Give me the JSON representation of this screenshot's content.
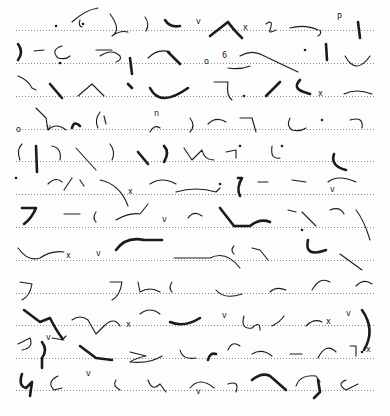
{
  "document": {
    "type": "shorthand-manuscript",
    "script": "Pitman shorthand",
    "ink_color": "#1b1b1b",
    "paper_color": "#fdfdfd",
    "rule_color": "#8a8a8a",
    "rule_x_start": 16,
    "rule_x_end": 376,
    "ruled_lines_y": [
      30,
      63,
      96,
      129,
      161,
      194,
      227,
      260,
      293,
      325,
      358,
      390
    ]
  },
  "strokes": [
    {
      "d": "M72 22 Q85 10 98 8",
      "w": "light"
    },
    {
      "d": "M80 20 Q78 26 82 27",
      "w": "light"
    },
    {
      "d": "M110 14 Q122 30 112 36 Q120 30 128 32",
      "w": "light"
    },
    {
      "d": "M145 17 Q150 24 146 31",
      "w": "light"
    },
    {
      "d": "M165 20 Q170 28 180 26",
      "w": "heavy"
    },
    {
      "d": "M210 36 L228 22 Q232 28 242 38",
      "w": "heavy"
    },
    {
      "d": "M266 24 Q274 18 270 30 Q268 34 276 30",
      "w": "light"
    },
    {
      "d": "M290 28 Q305 24 318 30",
      "w": "light"
    },
    {
      "d": "M320 30 Q322 34 318 36",
      "w": "light"
    },
    {
      "d": "M358 22 L360 38",
      "w": "heavy"
    },
    {
      "d": "M18 44 Q24 52 18 60",
      "w": "heavy"
    },
    {
      "d": "M34 51 L44 50",
      "w": "light"
    },
    {
      "d": "M62 46 Q50 50 58 58 Q66 60 70 56",
      "w": "light"
    },
    {
      "d": "M96 50 L112 50",
      "w": "light"
    },
    {
      "d": "M100 56 Q112 48 120 56 Q122 60 116 62",
      "w": "light"
    },
    {
      "d": "M130 58 L132 74",
      "w": "heavy"
    },
    {
      "d": "M148 58 Q158 48 170 52",
      "w": "light"
    },
    {
      "d": "M168 52 L180 64",
      "w": "heavy"
    },
    {
      "d": "M228 68 Q240 70 250 66",
      "w": "light"
    },
    {
      "d": "M240 56 Q250 50 260 54",
      "w": "light"
    },
    {
      "d": "M260 54 L298 72",
      "w": "light"
    },
    {
      "d": "M326 44 L327 60",
      "w": "heavy"
    },
    {
      "d": "M345 56 Q356 76 370 56",
      "w": "light"
    },
    {
      "d": "M18 76 Q28 80 32 88 L36 90",
      "w": "light"
    },
    {
      "d": "M50 84 L62 98",
      "w": "heavy"
    },
    {
      "d": "M78 96 L92 84 L104 96",
      "w": "light"
    },
    {
      "d": "M128 84 L132 88",
      "w": "heavy"
    },
    {
      "d": "M150 88 Q160 108 188 88",
      "w": "heavy"
    },
    {
      "d": "M214 82 L228 82 Q226 96 232 100",
      "w": "light"
    },
    {
      "d": "M266 96 L280 82",
      "w": "heavy"
    },
    {
      "d": "M300 80 Q292 88 304 92 L310 94",
      "w": "heavy"
    },
    {
      "d": "M344 94 Q356 88 372 94",
      "w": "light"
    },
    {
      "d": "M36 108 L46 118 L48 130 Q56 122 66 130",
      "w": "light"
    },
    {
      "d": "M72 128 Q74 120 80 126",
      "w": "heavy"
    },
    {
      "d": "M100 112 Q94 120 98 128",
      "w": "light"
    },
    {
      "d": "M104 116 L106 124",
      "w": "light"
    },
    {
      "d": "M150 132 Q154 124 160 128",
      "w": "light"
    },
    {
      "d": "M190 118 Q196 126 190 132",
      "w": "light"
    },
    {
      "d": "M208 124 Q216 116 226 122",
      "w": "light"
    },
    {
      "d": "M240 118 L252 118 L256 132",
      "w": "light"
    },
    {
      "d": "M290 118 Q286 126 292 130 Q300 132 306 128",
      "w": "light"
    },
    {
      "d": "M350 120 Q364 116 362 128",
      "w": "light"
    },
    {
      "d": "M22 144 Q16 150 20 160",
      "w": "light"
    },
    {
      "d": "M36 146 L37 172",
      "w": "heavy"
    },
    {
      "d": "M52 146 Q62 148 60 160",
      "w": "light"
    },
    {
      "d": "M76 148 L96 170",
      "w": "light"
    },
    {
      "d": "M110 144 Q116 152 112 160",
      "w": "light"
    },
    {
      "d": "M138 152 L148 164",
      "w": "heavy"
    },
    {
      "d": "M164 146 Q170 152 164 162",
      "w": "heavy"
    },
    {
      "d": "M184 148 L192 160 L202 150 Q204 160 214 160",
      "w": "light"
    },
    {
      "d": "M226 152 L236 150 L236 158",
      "w": "light"
    },
    {
      "d": "M272 146 Q270 160 280 158",
      "w": "light"
    },
    {
      "d": "M334 154 Q330 166 346 170",
      "w": "heavy"
    },
    {
      "d": "M48 184 Q56 176 62 182",
      "w": "light"
    },
    {
      "d": "M72 178 L64 190",
      "w": "light"
    },
    {
      "d": "M80 180 L84 186",
      "w": "light"
    },
    {
      "d": "M100 180 Q120 184 128 206",
      "w": "light"
    },
    {
      "d": "M150 184 Q162 176 176 184",
      "w": "light"
    },
    {
      "d": "M176 192 Q196 186 216 192 L220 188",
      "w": "light"
    },
    {
      "d": "M238 178 L242 178 Q236 188 240 196",
      "w": "heavy"
    },
    {
      "d": "M258 182 L268 182",
      "w": "light"
    },
    {
      "d": "M292 180 L306 182",
      "w": "light"
    },
    {
      "d": "M328 182 Q338 174 356 182",
      "w": "light"
    },
    {
      "d": "M22 208 L36 208 Q32 218 24 224",
      "w": "heavy"
    },
    {
      "d": "M64 214 L80 214",
      "w": "light"
    },
    {
      "d": "M96 212 Q92 218 96 222",
      "w": "light"
    },
    {
      "d": "M116 220 Q130 212 140 214 L148 204",
      "w": "light"
    },
    {
      "d": "M188 218 Q194 210 202 216",
      "w": "light"
    },
    {
      "d": "M220 208 L234 226 L250 226 Q260 218 270 222",
      "w": "heavy"
    },
    {
      "d": "M288 210 L296 212",
      "w": "light"
    },
    {
      "d": "M302 212 L316 226",
      "w": "light"
    },
    {
      "d": "M330 210 Q340 206 344 214",
      "w": "light"
    },
    {
      "d": "M356 210 Q364 220 370 240",
      "w": "light"
    },
    {
      "d": "M18 248 Q28 262 40 258 Q52 250 64 252",
      "w": "light"
    },
    {
      "d": "M116 250 Q126 236 144 240 L162 240",
      "w": "heavy"
    },
    {
      "d": "M174 258 L210 258 Q226 250 240 268",
      "w": "light"
    },
    {
      "d": "M234 246 Q230 250 234 254",
      "w": "light"
    },
    {
      "d": "M252 248 L260 250 L268 260",
      "w": "light"
    },
    {
      "d": "M308 240 Q304 258 326 250",
      "w": "heavy"
    },
    {
      "d": "M340 254 L362 270",
      "w": "light"
    },
    {
      "d": "M20 282 L32 284 Q30 296 22 300",
      "w": "light"
    },
    {
      "d": "M110 282 L122 282 Q120 296 112 300",
      "w": "light"
    },
    {
      "d": "M138 282 L140 292 Q150 286 160 292",
      "w": "light"
    },
    {
      "d": "M172 282 Q168 288 172 292",
      "w": "light"
    },
    {
      "d": "M216 290 Q224 300 242 294",
      "w": "light"
    },
    {
      "d": "M270 292 Q276 286 286 290",
      "w": "light"
    },
    {
      "d": "M312 290 Q320 276 330 282",
      "w": "light"
    },
    {
      "d": "M356 286 Q364 278 372 284",
      "w": "light"
    },
    {
      "d": "M24 310 L40 322 L50 318 Q56 330 62 338",
      "w": "heavy"
    },
    {
      "d": "M52 338 L64 340",
      "w": "light"
    },
    {
      "d": "M72 320 Q80 314 88 320 L96 334 L104 326 Q114 316 120 326",
      "w": "light"
    },
    {
      "d": "M140 314 Q150 306 160 314",
      "w": "light"
    },
    {
      "d": "M170 322 Q184 328 200 318",
      "w": "heavy"
    },
    {
      "d": "M244 316 Q240 330 252 328 Q260 320 260 330",
      "w": "light"
    },
    {
      "d": "M272 326 Q280 322 284 316",
      "w": "light"
    },
    {
      "d": "M306 326 Q314 318 322 322",
      "w": "light"
    },
    {
      "d": "M362 310 Q376 330 364 350",
      "w": "heavy"
    },
    {
      "d": "M18 344 L30 338 Q34 348 22 350",
      "w": "light"
    },
    {
      "d": "M42 342 Q48 350 42 358 L42 368",
      "w": "heavy"
    },
    {
      "d": "M62 340 L66 336",
      "w": "light"
    },
    {
      "d": "M80 346 L96 358 L112 360",
      "w": "heavy"
    },
    {
      "d": "M130 352 L146 356 Q136 358 130 362 Q150 364 162 356",
      "w": "light"
    },
    {
      "d": "M180 350 Q182 360 196 358",
      "w": "light"
    },
    {
      "d": "M208 360 Q210 352 216 354",
      "w": "heavy"
    },
    {
      "d": "M228 350 Q232 340 240 346",
      "w": "light"
    },
    {
      "d": "M252 354 Q262 348 272 356",
      "w": "light"
    },
    {
      "d": "M290 354 L302 354",
      "w": "light"
    },
    {
      "d": "M318 358 Q326 342 336 352",
      "w": "light"
    },
    {
      "d": "M350 346 L356 346 L356 356",
      "w": "light"
    },
    {
      "d": "M22 374 Q18 386 26 388 L32 382 L30 396",
      "w": "heavy"
    },
    {
      "d": "M58 376 Q46 382 54 390 L62 388",
      "w": "light"
    },
    {
      "d": "M116 380 Q112 386 120 390",
      "w": "light"
    },
    {
      "d": "M148 380 Q152 392 160 384 L166 392",
      "w": "light"
    },
    {
      "d": "M190 388 Q200 376 214 388",
      "w": "light"
    },
    {
      "d": "M228 384 Q240 380 236 392",
      "w": "light"
    },
    {
      "d": "M252 380 Q262 372 270 376 L286 390",
      "w": "heavy"
    },
    {
      "d": "M296 386 Q300 374 316 376 L320 382",
      "w": "light"
    },
    {
      "d": "M318 380 L320 392 L314 398",
      "w": "heavy"
    },
    {
      "d": "M346 380 Q336 384 346 390 L358 384",
      "w": "light"
    }
  ],
  "dots": [
    [
      56,
      26
    ],
    [
      83,
      24
    ],
    [
      305,
      50
    ],
    [
      60,
      63
    ],
    [
      244,
      96
    ],
    [
      322,
      120
    ],
    [
      240,
      146
    ],
    [
      282,
      146
    ],
    [
      16,
      178
    ],
    [
      220,
      184
    ],
    [
      302,
      230
    ],
    [
      362,
      352
    ]
  ],
  "marks": [
    {
      "t": "v",
      "x": 196,
      "y": 24
    },
    {
      "t": "x",
      "x": 243,
      "y": 30
    },
    {
      "t": "P",
      "x": 337,
      "y": 20
    },
    {
      "t": "o",
      "x": 204,
      "y": 64
    },
    {
      "t": "6",
      "x": 222,
      "y": 58
    },
    {
      "t": "x",
      "x": 318,
      "y": 96
    },
    {
      "t": "o",
      "x": 16,
      "y": 132
    },
    {
      "t": "v",
      "x": 46,
      "y": 130
    },
    {
      "t": "n",
      "x": 154,
      "y": 116
    },
    {
      "t": "v",
      "x": 330,
      "y": 192
    },
    {
      "t": "x",
      "x": 128,
      "y": 194
    },
    {
      "t": "v",
      "x": 162,
      "y": 222
    },
    {
      "t": "x",
      "x": 66,
      "y": 258
    },
    {
      "t": "v",
      "x": 96,
      "y": 256
    },
    {
      "t": "x",
      "x": 126,
      "y": 327
    },
    {
      "t": "v",
      "x": 222,
      "y": 318
    },
    {
      "t": "x",
      "x": 326,
      "y": 324
    },
    {
      "t": "v",
      "x": 346,
      "y": 316
    },
    {
      "t": "v",
      "x": 46,
      "y": 340
    },
    {
      "t": "x",
      "x": 366,
      "y": 352
    },
    {
      "t": "v",
      "x": 86,
      "y": 376
    },
    {
      "t": "v",
      "x": 196,
      "y": 394
    }
  ]
}
